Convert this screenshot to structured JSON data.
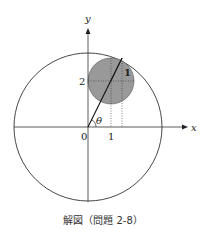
{
  "figure": {
    "caption": "解図（問題 2-8）",
    "axes": {
      "x_label": "x",
      "y_label": "y",
      "origin_label": "0"
    },
    "tick_labels": {
      "x_one": "1",
      "y_two": "2"
    },
    "angle_label": "θ",
    "radius_label": "1",
    "colors": {
      "line": "#222222",
      "small_circle_fill": "#999999",
      "dotted": "#555555"
    }
  }
}
